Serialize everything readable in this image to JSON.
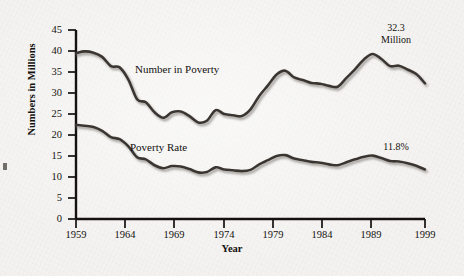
{
  "chart_data": {
    "type": "line",
    "title": "",
    "xlabel": "Year",
    "ylabel": "Numbers in Millions",
    "xlim": [
      1959,
      1999
    ],
    "ylim": [
      0,
      45
    ],
    "ytick_values": [
      0,
      5,
      10,
      15,
      20,
      25,
      30,
      35,
      40,
      45
    ],
    "ytick_labels": [
      "0",
      "5",
      "10",
      "15",
      "20",
      "25",
      "30",
      "35",
      "40",
      "45"
    ],
    "xtick_values": [
      1959,
      1964,
      1969,
      1974,
      1979,
      1984,
      1989,
      1999
    ],
    "xtick_labels": [
      "1959",
      "1964",
      "1969",
      "1974",
      "1979",
      "1984",
      "1989",
      "1999"
    ],
    "grid": false,
    "legend_position": "inline-labels",
    "line_color": "#3a3632",
    "shadow_color": "#b9b5b0",
    "x": [
      1959,
      1960,
      1961,
      1962,
      1963,
      1964,
      1965,
      1966,
      1967,
      1968,
      1969,
      1970,
      1971,
      1972,
      1973,
      1974,
      1975,
      1976,
      1977,
      1978,
      1979,
      1980,
      1981,
      1982,
      1983,
      1984,
      1985,
      1986,
      1987,
      1988,
      1989,
      1990,
      1991,
      1992,
      1993,
      1994,
      1995,
      1996,
      1997,
      1998,
      1999
    ],
    "series": [
      {
        "name": "Number in Poverty",
        "units": "millions",
        "values": [
          39.5,
          39.9,
          39.6,
          38.6,
          36.4,
          36.1,
          33.2,
          28.5,
          27.8,
          25.4,
          24.1,
          25.4,
          25.6,
          24.5,
          23.0,
          23.4,
          25.9,
          25.0,
          24.7,
          24.5,
          26.1,
          29.3,
          31.8,
          34.4,
          35.3,
          33.7,
          33.1,
          32.4,
          32.2,
          31.7,
          31.5,
          33.6,
          35.7,
          38.0,
          39.3,
          38.1,
          36.4,
          36.5,
          35.6,
          34.5,
          32.3
        ],
        "end_label": "32.3 Million"
      },
      {
        "name": "Poverty Rate",
        "units": "percent",
        "values": [
          22.4,
          22.2,
          21.9,
          21.0,
          19.5,
          19.0,
          17.3,
          14.7,
          14.2,
          12.8,
          12.1,
          12.6,
          12.5,
          11.9,
          11.1,
          11.2,
          12.3,
          11.8,
          11.6,
          11.4,
          11.7,
          13.0,
          14.0,
          15.0,
          15.2,
          14.4,
          14.0,
          13.6,
          13.4,
          13.0,
          12.8,
          13.5,
          14.2,
          14.8,
          15.1,
          14.5,
          13.8,
          13.7,
          13.3,
          12.7,
          11.8
        ],
        "end_label": "11.8%"
      }
    ],
    "annotations": [
      {
        "name": "number-in-poverty-label",
        "text": "Number in Poverty"
      },
      {
        "name": "poverty-rate-label",
        "text": "Poverty Rate"
      },
      {
        "name": "number-end-annotation",
        "line1": "32.3",
        "line2": "Million"
      },
      {
        "name": "rate-end-annotation",
        "text": "11.8%"
      }
    ]
  }
}
